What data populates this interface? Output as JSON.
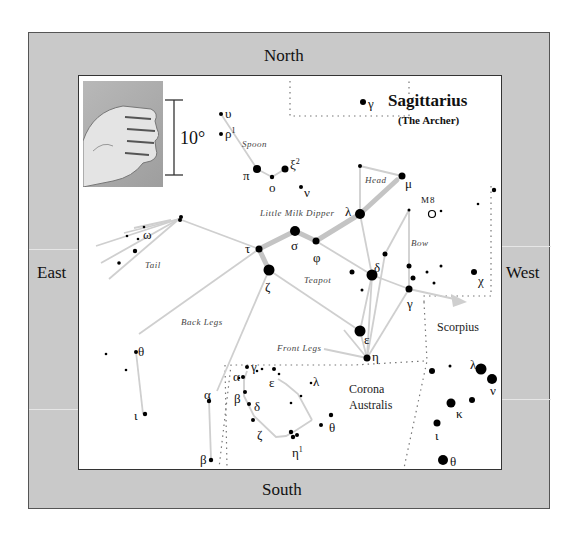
{
  "directions": {
    "north": "North",
    "south": "South",
    "east": "East",
    "west": "West"
  },
  "title": {
    "name": "Sagittarius",
    "subtitle": "(The Archer)"
  },
  "scale": {
    "label": "10°",
    "description": "fist held at arm's length"
  },
  "regions": {
    "scorpius": "Scorpius",
    "corona_line1": "Corona",
    "corona_line2": "Australis"
  },
  "asterisms": {
    "spoon": "Spoon",
    "head": "Head",
    "little_milk_dipper": "Little Milk Dipper",
    "bow": "Bow",
    "teapot": "Teapot",
    "tail": "Tail",
    "back_legs": "Back Legs",
    "front_legs": "Front Legs"
  },
  "deep_sky": {
    "m8": "M8"
  },
  "stars": {
    "sgr": {
      "upsilon": "υ",
      "rho1": "ρ",
      "rho1_sup": "1",
      "pi": "π",
      "omicron": "ο",
      "xi2": "ξ",
      "xi2_sup": "2",
      "nu": "ν",
      "mu": "μ",
      "lambda": "λ",
      "sigma": "σ",
      "phi": "φ",
      "tau": "τ",
      "zeta": "ζ",
      "delta": "δ",
      "gamma": "γ",
      "epsilon": "ε",
      "eta": "η",
      "chi": "χ",
      "omega": "ω",
      "theta": "θ",
      "iota": "ι",
      "alpha": "α",
      "beta": "β",
      "gamma_north": "γ"
    },
    "cra": {
      "alpha": "α",
      "gamma": "γ",
      "beta": "β",
      "delta": "δ",
      "epsilon": "ε",
      "zeta": "ζ",
      "lambda": "λ",
      "theta": "θ",
      "eta1": "η",
      "eta1_sup": "1"
    },
    "sco": {
      "lambda": "λ",
      "nu": "ν",
      "kappa": "κ",
      "iota": "ι",
      "theta": "θ"
    }
  },
  "colors": {
    "frame": "#c9c9c9",
    "chart_bg": "#ffffff",
    "star": "#000000",
    "line": "#cfcfcf",
    "boundary": "#777777"
  }
}
